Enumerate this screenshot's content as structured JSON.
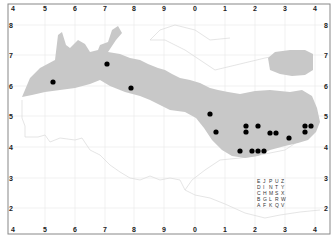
{
  "map": {
    "top_ticks": [
      "4",
      "5",
      "6",
      "7",
      "8",
      "9",
      "0",
      "1",
      "2",
      "3",
      "4"
    ],
    "bottom_ticks": [
      "4",
      "5",
      "6",
      "7",
      "8",
      "9",
      "0",
      "1",
      "2",
      "3",
      "4"
    ],
    "left_ticks": [
      "8",
      "7",
      "6",
      "5",
      "4",
      "3",
      "2"
    ],
    "right_ticks": [
      "8",
      "7",
      "6",
      "5",
      "4",
      "3",
      "2"
    ],
    "colors": {
      "region_fill": "#c8c8c8",
      "dot": "#000000",
      "grid": "#e6e6e6",
      "frame": "#888888",
      "coast_line": "#d8d8d8"
    },
    "dots": [
      {
        "x": 53,
        "y": 82
      },
      {
        "x": 107,
        "y": 64
      },
      {
        "x": 131,
        "y": 88
      },
      {
        "x": 210,
        "y": 114
      },
      {
        "x": 216,
        "y": 132
      },
      {
        "x": 246,
        "y": 126
      },
      {
        "x": 246,
        "y": 132
      },
      {
        "x": 258,
        "y": 126
      },
      {
        "x": 270,
        "y": 133
      },
      {
        "x": 276,
        "y": 133
      },
      {
        "x": 289,
        "y": 138
      },
      {
        "x": 305,
        "y": 126
      },
      {
        "x": 311,
        "y": 126
      },
      {
        "x": 305,
        "y": 132
      },
      {
        "x": 240,
        "y": 151
      },
      {
        "x": 252,
        "y": 151
      },
      {
        "x": 258,
        "y": 151
      },
      {
        "x": 264,
        "y": 151
      }
    ],
    "letter_grid": [
      [
        "E",
        "J",
        "P",
        "U",
        "Z"
      ],
      [
        "D",
        "I",
        "N",
        "T",
        "Y"
      ],
      [
        "C",
        "H",
        "M",
        "S",
        "X"
      ],
      [
        "B",
        "G",
        "L",
        "R",
        "W"
      ],
      [
        "A",
        "F",
        "K",
        "Q",
        "V"
      ]
    ]
  }
}
